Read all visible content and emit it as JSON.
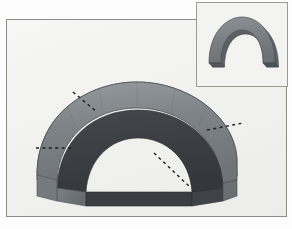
{
  "app": {
    "kind": "3d-geometry-viewer",
    "background_color": "#fdfdfd"
  },
  "viewport": {
    "name": "main-3d-viewport",
    "background_color": "#f2f2f0",
    "border_color": "#8d8d85",
    "x": 6,
    "y": 19,
    "width": 281,
    "height": 198
  },
  "inset": {
    "name": "front-view-thumbnail",
    "background_color": "#f3f3f1",
    "border_color": "#9a9a92",
    "x": 196,
    "y": 2,
    "width": 92,
    "height": 85
  },
  "model": {
    "shape_name": "half-annular-vault",
    "description": "Half annulus extruded into a barrel vault (half tube)",
    "outer_surface_color": "#7c8186",
    "top_band_color": "#8d9297",
    "front_face_color": "#3b3f43",
    "inner_face_color": "#5f6469",
    "base_face_color": "#6e7479",
    "edge_color": "#2f3337",
    "shading": "flat-faceted"
  },
  "annotations": {
    "axis_line_color": "#1d1d1d",
    "axis_line_style": "dashed",
    "axes": [
      {
        "name": "axis-upper-left",
        "x1": 73,
        "y1": 92,
        "x2": 93,
        "y2": 108
      },
      {
        "name": "axis-left",
        "x1": 38,
        "y1": 147,
        "x2": 70,
        "y2": 147
      },
      {
        "name": "axis-right",
        "x1": 204,
        "y1": 128,
        "x2": 236,
        "y2": 122
      },
      {
        "name": "axis-lower-right",
        "x1": 152,
        "y1": 152,
        "x2": 186,
        "y2": 184
      }
    ]
  },
  "inset_model": {
    "shape_name": "arch-front-view",
    "outer_color": "#7c8186",
    "side_color": "#646a6f",
    "edge_color": "#3b3f43"
  }
}
